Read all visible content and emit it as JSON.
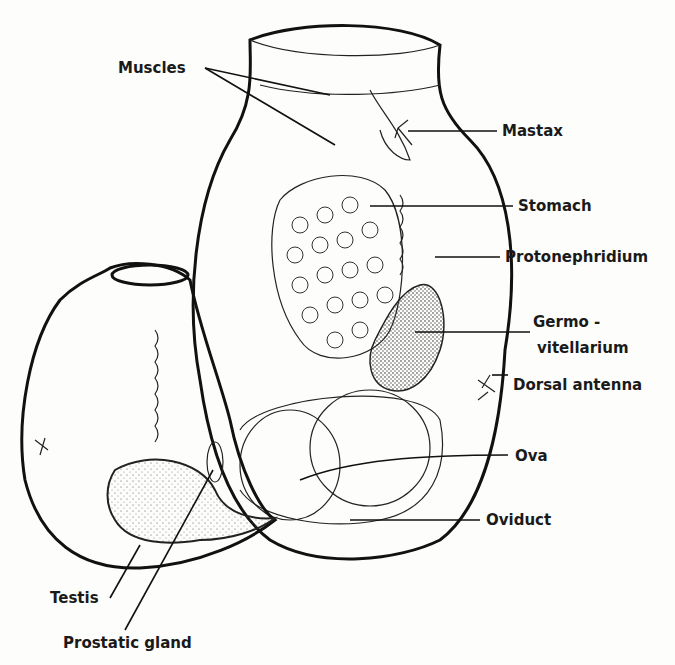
{
  "figure": {
    "labels": {
      "muscles": "Muscles",
      "mastax": "Mastax",
      "stomach": "Stomach",
      "protonephridium": "Protonephridium",
      "germovitellarium_1": "Germo -",
      "germovitellarium_2": "vitellarium",
      "dorsal_antenna": "Dorsal antenna",
      "ova": "Ova",
      "oviduct": "Oviduct",
      "testis": "Testis",
      "prostatic_gland": "Prostatic gland"
    }
  }
}
